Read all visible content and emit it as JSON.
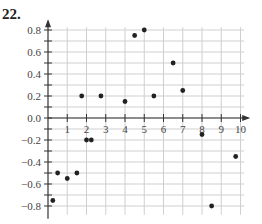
{
  "problem": {
    "number": "22."
  },
  "chart_data": {
    "type": "scatter",
    "title": "",
    "xlabel": "",
    "ylabel": "",
    "xlim": [
      0,
      10.5
    ],
    "ylim": [
      -0.85,
      0.85
    ],
    "grid": true,
    "x_ticks": [
      1,
      2,
      3,
      4,
      5,
      6,
      7,
      8,
      9,
      10
    ],
    "y_ticks": [
      0.8,
      0.6,
      0.4,
      0.2,
      0.0,
      -0.2,
      -0.4,
      -0.6,
      -0.8
    ],
    "x_tick_labels": [
      "1",
      "2",
      "3",
      "4",
      "5",
      "6",
      "7",
      "8",
      "9",
      "10"
    ],
    "y_tick_labels": [
      "0.8",
      "0.6",
      "0.4",
      "0.2",
      "0.0",
      "−0.2",
      "−0.4",
      "−0.6",
      "−0.8"
    ],
    "points": [
      {
        "x": 0.25,
        "y": -0.75
      },
      {
        "x": 0.5,
        "y": -0.5
      },
      {
        "x": 1.0,
        "y": -0.55
      },
      {
        "x": 1.5,
        "y": -0.5
      },
      {
        "x": 2.0,
        "y": -0.2
      },
      {
        "x": 2.25,
        "y": -0.2
      },
      {
        "x": 1.75,
        "y": 0.2
      },
      {
        "x": 2.75,
        "y": 0.2
      },
      {
        "x": 4.0,
        "y": 0.15
      },
      {
        "x": 4.5,
        "y": 0.75
      },
      {
        "x": 5.0,
        "y": 0.8
      },
      {
        "x": 5.5,
        "y": 0.2
      },
      {
        "x": 6.5,
        "y": 0.5
      },
      {
        "x": 7.0,
        "y": 0.25
      },
      {
        "x": 8.0,
        "y": -0.15
      },
      {
        "x": 8.5,
        "y": -0.8
      },
      {
        "x": 9.75,
        "y": -0.35
      }
    ]
  }
}
